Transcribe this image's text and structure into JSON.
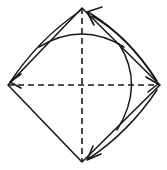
{
  "figure": {
    "background_color": "#ffffff",
    "stroke_color": "#1a1a1a",
    "canvas": {
      "width": 167,
      "height": 170
    }
  },
  "geometry": {
    "center": {
      "x": 82,
      "y": 85
    },
    "vertices": {
      "top": {
        "x": 82,
        "y": 8,
        "label": "top-vertex"
      },
      "right": {
        "x": 160,
        "y": 85,
        "label": "right-vertex"
      },
      "bottom": {
        "x": 82,
        "y": 162,
        "label": "bottom-vertex"
      },
      "left": {
        "x": 8,
        "y": 85,
        "label": "left-vertex"
      }
    },
    "rhombus_path": "M 82 8 L 160 85 L 82 162 L 8 85 Z",
    "axes": {
      "vertical_path": "M 82 8 L 82 162",
      "horizontal_path": "M 8 85 L 160 85",
      "style": "dashed",
      "dash_pattern": "6 4"
    },
    "arcs": [
      {
        "name": "upper-horizontal-arc",
        "orientation": "horizontal",
        "bulge": "upward",
        "path": "M 39 47 Q 82 21 124 47",
        "apex": {
          "x": 82,
          "y": 33
        }
      },
      {
        "name": "right-vertical-arc",
        "orientation": "vertical",
        "bulge": "rightward",
        "path": "M 119 44 Q 145 85 117 130",
        "apex": {
          "x": 132,
          "y": 85
        }
      }
    ],
    "arrows": [
      {
        "name": "arrow-top-to-left",
        "from": "top-vertex",
        "to": "left-vertex",
        "direction": "down-left",
        "curve_path": "M 80 11 Q 38 40 11 81",
        "head_path": "M 21 74 L 10 82 L 21 88"
      },
      {
        "name": "arrow-right-to-top",
        "from": "right-vertex",
        "to": "top-vertex",
        "direction": "up-left",
        "curve_path": "M 156 80 Q 128 36 88 12",
        "head_path": "M 102 7 L 87 12 L 94 25"
      },
      {
        "name": "arrow-upper-right-to-right",
        "from": "top-region",
        "to": "right-vertex",
        "direction": "down-right",
        "curve_path": "M 92 16 Q 128 36 157 81",
        "head_path": "M 146 77 L 158 84 L 148 92"
      },
      {
        "name": "arrow-right-to-bottom",
        "from": "right-vertex",
        "to": "bottom-vertex",
        "direction": "down-left",
        "curve_path": "M 157 90 Q 128 133 88 159",
        "head_path": "M 101 154 L 87 160 L 93 146"
      }
    ]
  },
  "legend": {
    "solid_line": "rhombus edges and arcs",
    "dashed_line": "symmetry axes (diagonals)",
    "arrow": "direction of traversal"
  }
}
